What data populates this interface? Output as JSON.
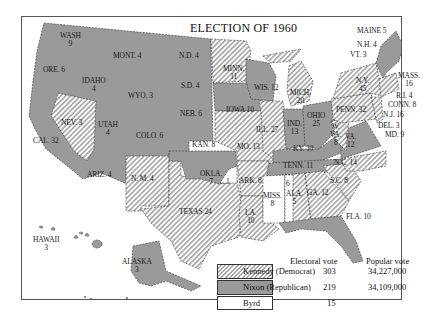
{
  "title": "ELECTION OF 1960",
  "colors": {
    "kennedy_hatch": "#a9a9a9",
    "nixon_fill": "#9a9a9a",
    "byrd_fill": "#ffffff",
    "border": "#333333"
  },
  "legend": {
    "electoral_header": "Electoral vote",
    "popular_header": "Popular vote",
    "rows": [
      {
        "name": "Kennedy (Democrat)",
        "electoral": "303",
        "popular": "34,227,000",
        "pattern": "hatched"
      },
      {
        "name": "Nixon (Republican)",
        "electoral": "219",
        "popular": "34,109,000",
        "pattern": "solid-gray"
      },
      {
        "name": "Byrd",
        "electoral": "15",
        "popular": "",
        "pattern": "white"
      }
    ]
  },
  "states": [
    {
      "label": "WASH",
      "votes": "9",
      "winner": "Nixon"
    },
    {
      "label": "ORE.",
      "votes": "6",
      "winner": "Nixon"
    },
    {
      "label": "CAL.",
      "votes": "32",
      "winner": "Nixon"
    },
    {
      "label": "IDAHO",
      "votes": "4",
      "winner": "Nixon"
    },
    {
      "label": "NEV.",
      "votes": "3",
      "winner": "Kennedy"
    },
    {
      "label": "MONT.",
      "votes": "4",
      "winner": "Nixon"
    },
    {
      "label": "WYO.",
      "votes": "3",
      "winner": "Nixon"
    },
    {
      "label": "UTAH",
      "votes": "4",
      "winner": "Nixon"
    },
    {
      "label": "COLO.",
      "votes": "6",
      "winner": "Nixon"
    },
    {
      "label": "ARIZ.",
      "votes": "4",
      "winner": "Nixon"
    },
    {
      "label": "N. M.",
      "votes": "4",
      "winner": "Kennedy"
    },
    {
      "label": "N.D.",
      "votes": "4",
      "winner": "Nixon"
    },
    {
      "label": "S.D.",
      "votes": "4",
      "winner": "Nixon"
    },
    {
      "label": "NEB.",
      "votes": "6",
      "winner": "Nixon"
    },
    {
      "label": "KAN.",
      "votes": "8",
      "winner": "Nixon"
    },
    {
      "label": "OKLA.",
      "votes": "7",
      "winner": "Nixon"
    },
    {
      "label": "OKLA. (Byrd)",
      "votes": "1",
      "winner": "Byrd"
    },
    {
      "label": "TEXAS",
      "votes": "24",
      "winner": "Kennedy"
    },
    {
      "label": "MINN.",
      "votes": "11",
      "winner": "Kennedy"
    },
    {
      "label": "IOWA",
      "votes": "10",
      "winner": "Nixon"
    },
    {
      "label": "MO.",
      "votes": "13",
      "winner": "Kennedy"
    },
    {
      "label": "ARK.",
      "votes": "8",
      "winner": "Kennedy"
    },
    {
      "label": "LA.",
      "votes": "10",
      "winner": "Kennedy"
    },
    {
      "label": "WIS.",
      "votes": "12",
      "winner": "Nixon"
    },
    {
      "label": "ILL.",
      "votes": "27",
      "winner": "Kennedy"
    },
    {
      "label": "MICH.",
      "votes": "20",
      "winner": "Kennedy"
    },
    {
      "label": "IND.",
      "votes": "13",
      "winner": "Nixon"
    },
    {
      "label": "OHIO",
      "votes": "25",
      "winner": "Nixon"
    },
    {
      "label": "KY.",
      "votes": "10",
      "winner": "Nixon"
    },
    {
      "label": "TENN.",
      "votes": "11",
      "winner": "Nixon"
    },
    {
      "label": "MISS.",
      "votes": "8",
      "winner": "Byrd"
    },
    {
      "label": "ALA. (Byrd)",
      "votes": "6",
      "winner": "Byrd"
    },
    {
      "label": "ALA.",
      "votes": "5",
      "winner": "Kennedy"
    },
    {
      "label": "GA.",
      "votes": "12",
      "winner": "Kennedy"
    },
    {
      "label": "FLA.",
      "votes": "10",
      "winner": "Nixon"
    },
    {
      "label": "S.C.",
      "votes": "8",
      "winner": "Kennedy"
    },
    {
      "label": "N.C.",
      "votes": "14",
      "winner": "Kennedy"
    },
    {
      "label": "VA.",
      "votes": "12",
      "winner": "Nixon"
    },
    {
      "label": "W. VA.",
      "votes": "8",
      "winner": "Kennedy"
    },
    {
      "label": "PENN.",
      "votes": "32",
      "winner": "Kennedy"
    },
    {
      "label": "N.Y.",
      "votes": "45",
      "winner": "Kennedy"
    },
    {
      "label": "MAINE",
      "votes": "5",
      "winner": "Nixon"
    },
    {
      "label": "N.H.",
      "votes": "4",
      "winner": "Nixon"
    },
    {
      "label": "VT.",
      "votes": "3",
      "winner": "Nixon"
    },
    {
      "label": "MASS.",
      "votes": "16",
      "winner": "Kennedy"
    },
    {
      "label": "R.I.",
      "votes": "4",
      "winner": "Kennedy"
    },
    {
      "label": "CONN.",
      "votes": "8",
      "winner": "Kennedy"
    },
    {
      "label": "N.J.",
      "votes": "16",
      "winner": "Kennedy"
    },
    {
      "label": "DEL.",
      "votes": "3",
      "winner": "Kennedy"
    },
    {
      "label": "MD.",
      "votes": "9",
      "winner": "Kennedy"
    },
    {
      "label": "HAWAII",
      "votes": "3",
      "winner": "Kennedy"
    },
    {
      "label": "ALASKA",
      "votes": "3",
      "winner": "Nixon"
    }
  ],
  "labels": {
    "wash": "WASH",
    "wash_v": "9",
    "ore": "ORE. 6",
    "cal": "CAL. 32",
    "idaho": "IDAHO",
    "idaho_v": "4",
    "nev": "NEV. 3",
    "mont": "MONT. 4",
    "wyo": "WYO. 3",
    "utah": "UTAH",
    "utah_v": "4",
    "colo": "COLO. 6",
    "ariz": "ARIZ. 4",
    "nm": "N. M. 4",
    "nd": "N.D. 4",
    "sd": "S.D. 4",
    "neb": "NEB. 6",
    "kan": "KAN. 8",
    "okla": "OKLA.",
    "okla_v": "7",
    "okla_byrd": "1",
    "texas": "TEXAS 24",
    "minn": "MINN.",
    "minn_v": "11",
    "iowa": "IOWA 10",
    "mo": "MO. 13",
    "ark": "ARK. 8",
    "la": "LA.",
    "la_v": "10",
    "wis": "WIS. 12",
    "ill": "ILL. 27",
    "mich": "MICH.",
    "mich_v": "20",
    "ind": "IND.",
    "ind_v": "13",
    "ohio": "OHIO",
    "ohio_v": "25",
    "ky": "KY. 10",
    "tenn": "TENN. 11",
    "miss": "MISS.",
    "miss_v": "8",
    "ala_byrd": "6",
    "ala": "ALA.",
    "ala_v": "5",
    "ga": "GA. 12",
    "fla": "FLA. 10",
    "sc": "S.C. 8",
    "nc": "N.C. 14",
    "va": "VA.",
    "va_v": "12",
    "wva": "W.",
    "wva2": "VA.",
    "wva_v": "8",
    "penn": "PENN. 32",
    "ny": "N.Y.",
    "ny_v": "45",
    "maine": "MAINE 5",
    "nh": "N.H. 4",
    "vt": "VT. 3",
    "mass": "MASS.",
    "mass_v": "16",
    "ri": "R.I. 4",
    "conn": "CONN. 8",
    "nj": "N.J. 16",
    "del": "DEL. 3",
    "md": "MD. 9",
    "hawaii": "HAWAII",
    "hawaii_v": "3",
    "alaska": "ALASKA",
    "alaska_v": "3"
  }
}
